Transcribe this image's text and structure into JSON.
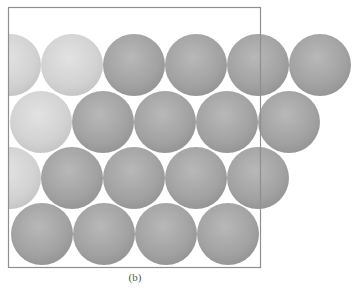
{
  "figure": {
    "caption": "(b)",
    "colors": {
      "frame": "#8f8f8f",
      "sphere_light": "#d3d3d3",
      "sphere_dark": "#a3a3a3",
      "background": "#ffffff"
    },
    "rows": [
      {
        "row": 1,
        "spheres": [
          "light",
          "light",
          "dark",
          "dark",
          "dark",
          "dark"
        ]
      },
      {
        "row": 2,
        "spheres": [
          "light",
          "dark",
          "dark",
          "dark",
          "dark"
        ]
      },
      {
        "row": 3,
        "spheres": [
          "light",
          "dark",
          "dark",
          "dark",
          "dark"
        ]
      },
      {
        "row": 4,
        "spheres": [
          "dark",
          "dark",
          "dark",
          "dark"
        ]
      }
    ]
  }
}
